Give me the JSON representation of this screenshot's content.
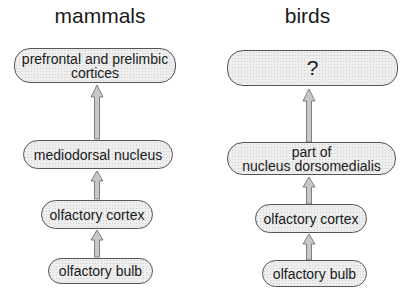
{
  "columns": [
    {
      "title": "mammals",
      "boxes": [
        {
          "label": "prefrontal and prelimbic\ncortices"
        },
        {
          "label": "mediodorsal nucleus"
        },
        {
          "label": "olfactory cortex"
        },
        {
          "label": "olfactory bulb"
        }
      ]
    },
    {
      "title": "birds",
      "boxes": [
        {
          "label": "?"
        },
        {
          "label": "part of\nnucleus dorsomedialis"
        },
        {
          "label": "olfactory cortex"
        },
        {
          "label": "olfactory bulb"
        }
      ]
    }
  ],
  "colors": {
    "box_fill": "#eeeeee",
    "box_border": "#555555",
    "arrow_fill": "#c8c8c8",
    "arrow_stroke": "#666666"
  }
}
